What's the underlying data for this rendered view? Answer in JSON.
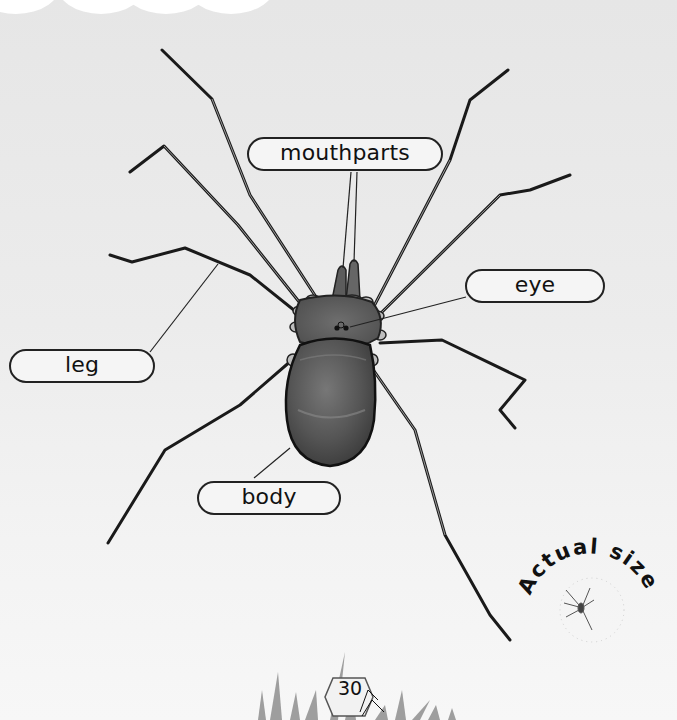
{
  "diagram": {
    "labels": {
      "mouthparts": "mouthparts",
      "eye": "eye",
      "leg": "leg",
      "body": "body"
    }
  },
  "actual_size_badge": {
    "text": "Actual size"
  },
  "footer": {
    "page_number": "30"
  },
  "colors": {
    "background": "#ececec",
    "label_border": "#222222",
    "body_fill": "#5a5a5a",
    "leg_stroke": "#1a1a1a"
  }
}
